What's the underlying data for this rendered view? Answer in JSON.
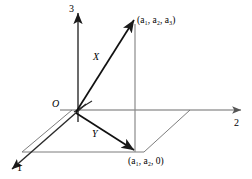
{
  "figure": {
    "type": "3d-vector-diagram",
    "background_color": "#ffffff",
    "stroke_color": "#1a1a1a",
    "guide_color": "#8a8a8a",
    "axes": [
      {
        "name": "axis-1",
        "label": "1",
        "direction": "down-left",
        "arrow": true
      },
      {
        "name": "axis-2",
        "label": "2",
        "direction": "right",
        "arrow": true
      },
      {
        "name": "axis-3",
        "label": "3",
        "direction": "up",
        "arrow": true
      }
    ],
    "origin": {
      "label": "O"
    },
    "vectors": [
      {
        "name": "X",
        "label": "X",
        "from": "origin",
        "to": "(a1, a2, a3)"
      },
      {
        "name": "Y",
        "label": "Y",
        "from": "origin",
        "to": "(a1, a2, 0)"
      }
    ],
    "points": [
      {
        "name": "point-top",
        "label": "(a₁, a₂, a₃)"
      },
      {
        "name": "point-bottom",
        "label": "(a₁, a₂, 0)"
      }
    ],
    "guides": {
      "vertical_connector": "from (a1,a2,a3) down to (a1,a2,0)",
      "ground_parallelogram": true
    }
  }
}
